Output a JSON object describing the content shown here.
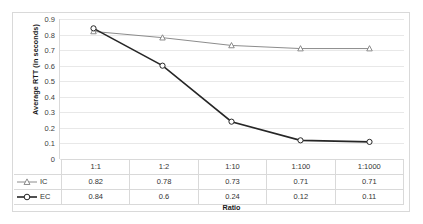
{
  "chart_data": {
    "type": "line",
    "title": "",
    "xlabel": "Ratio",
    "ylabel": "Average RTT (in seconds)",
    "categories": [
      "1:1",
      "1:2",
      "1:10",
      "1:100",
      "1:1000"
    ],
    "series": [
      {
        "name": "IC",
        "values": [
          0.82,
          0.78,
          0.73,
          0.71,
          0.71
        ],
        "marker": "triangle-open",
        "color": "#7f7f7f"
      },
      {
        "name": "EC",
        "values": [
          0.84,
          0.6,
          0.24,
          0.12,
          0.11
        ],
        "marker": "circle-open",
        "color": "#262626"
      }
    ],
    "ylim": [
      0,
      0.9
    ],
    "yticks": [
      "0",
      "0.1",
      "0.2",
      "0.3",
      "0.4",
      "0.5",
      "0.6",
      "0.7",
      "0.8",
      "0.9"
    ],
    "ytick_values": [
      0,
      0.1,
      0.2,
      0.3,
      0.4,
      0.5,
      0.6,
      0.7,
      0.8,
      0.9
    ],
    "grid": true,
    "legend_position": "data-table-left",
    "data_table": {
      "visible": true,
      "header_row": [
        "1:1",
        "1:2",
        "1:10",
        "1:100",
        "1:1000"
      ],
      "rows": [
        {
          "label": "IC",
          "values": [
            "0.82",
            "0.78",
            "0.73",
            "0.71",
            "0.71"
          ]
        },
        {
          "label": "EC",
          "values": [
            "0.84",
            "0.6",
            "0.24",
            "0.12",
            "0.11"
          ]
        }
      ]
    }
  },
  "colors": {
    "series_ic": "#7f7f7f",
    "series_ec": "#262626",
    "gridline": "#e8e8e8",
    "border": "#d9d9d9",
    "text": "#333333"
  }
}
